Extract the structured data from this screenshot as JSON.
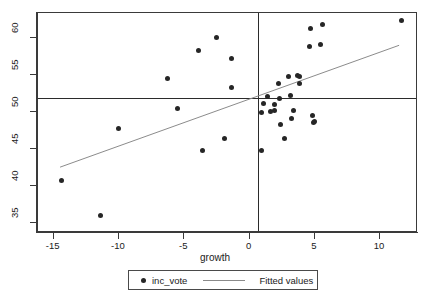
{
  "chart_data": {
    "type": "scatter",
    "title": "",
    "xlabel": "growth",
    "ylabel": "",
    "xlim": [
      -16.2,
      12.9
    ],
    "ylim": [
      33.7,
      63.4
    ],
    "grid": false,
    "legend_position": "bottom-center",
    "x_ticks": [
      -15,
      -10,
      -5,
      0,
      5,
      10
    ],
    "y_ticks": [
      35,
      40,
      45,
      50,
      55,
      60
    ],
    "x_tick_labels": [
      "-15",
      "-10",
      "-5",
      "0",
      "5",
      "10"
    ],
    "y_tick_labels": [
      "35",
      "40",
      "45",
      "50",
      "55",
      "60"
    ],
    "series": [
      {
        "name": "inc_vote",
        "type": "scatter",
        "marker": "circle",
        "color": "#262626",
        "points": [
          {
            "x": -14.4,
            "y": 40.8
          },
          {
            "x": -11.4,
            "y": 36.1
          },
          {
            "x": -10.0,
            "y": 47.8
          },
          {
            "x": -6.3,
            "y": 54.6
          },
          {
            "x": -5.5,
            "y": 50.5
          },
          {
            "x": -3.9,
            "y": 58.4
          },
          {
            "x": -3.6,
            "y": 44.9
          },
          {
            "x": -2.5,
            "y": 60.1
          },
          {
            "x": -1.9,
            "y": 46.4
          },
          {
            "x": -1.4,
            "y": 57.2
          },
          {
            "x": -1.4,
            "y": 53.3
          },
          {
            "x": 0.9,
            "y": 44.8
          },
          {
            "x": 0.9,
            "y": 50.0
          },
          {
            "x": 1.1,
            "y": 51.2
          },
          {
            "x": 1.4,
            "y": 52.1
          },
          {
            "x": 1.6,
            "y": 50.1
          },
          {
            "x": 1.9,
            "y": 51.1
          },
          {
            "x": 1.9,
            "y": 50.3
          },
          {
            "x": 2.2,
            "y": 53.9
          },
          {
            "x": 2.3,
            "y": 51.9
          },
          {
            "x": 2.4,
            "y": 48.4
          },
          {
            "x": 2.7,
            "y": 46.5
          },
          {
            "x": 3.0,
            "y": 54.8
          },
          {
            "x": 3.1,
            "y": 52.3
          },
          {
            "x": 3.2,
            "y": 49.1
          },
          {
            "x": 3.4,
            "y": 50.3
          },
          {
            "x": 3.7,
            "y": 54.9
          },
          {
            "x": 3.8,
            "y": 54.8
          },
          {
            "x": 3.8,
            "y": 53.9
          },
          {
            "x": 4.7,
            "y": 61.3
          },
          {
            "x": 4.6,
            "y": 58.9
          },
          {
            "x": 4.8,
            "y": 49.6
          },
          {
            "x": 4.9,
            "y": 48.6
          },
          {
            "x": 5.0,
            "y": 48.7
          },
          {
            "x": 5.4,
            "y": 59.2
          },
          {
            "x": 5.6,
            "y": 61.8
          },
          {
            "x": 11.6,
            "y": 62.4
          }
        ]
      },
      {
        "name": "Fitted values",
        "type": "line",
        "color": "#8a8a8a",
        "x_start": -14.5,
        "y_start": 42.4,
        "x_end": 11.6,
        "y_end": 59.0
      }
    ],
    "reference_lines": [
      {
        "orientation": "vertical",
        "x": 0.65,
        "color": "#2b2b2b"
      },
      {
        "orientation": "horizontal",
        "y": 51.9,
        "color": "#2b2b2b"
      }
    ],
    "legend": [
      {
        "label": "inc_vote",
        "marker": "circle",
        "color": "#262626"
      },
      {
        "label": "Fitted values",
        "marker": "line",
        "color": "#8a8a8a"
      }
    ]
  },
  "axes": {
    "x_title": "growth"
  },
  "legend": {
    "item1_label": "inc_vote",
    "item2_label": "Fitted values"
  },
  "colors": {
    "marker": "#262626",
    "fitline": "#8a8a8a",
    "refline": "#2b2b2b",
    "frame": "#3a3a3a",
    "background": "#ffffff"
  }
}
